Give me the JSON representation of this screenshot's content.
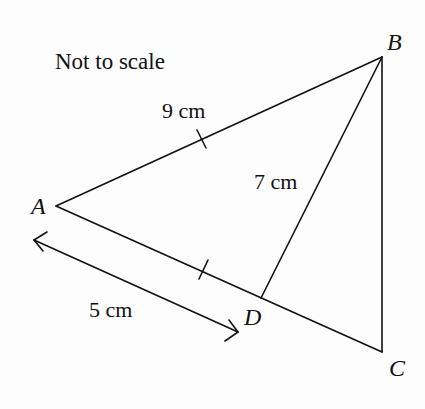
{
  "diagram": {
    "note": "Not to scale",
    "vertices": {
      "A": {
        "label": "A",
        "x": 56,
        "y": 206
      },
      "B": {
        "label": "B",
        "x": 382,
        "y": 57
      },
      "C": {
        "label": "C",
        "x": 382,
        "y": 352
      },
      "D": {
        "label": "D",
        "x": 261,
        "y": 298
      }
    },
    "segments": [
      {
        "from": "A",
        "to": "B",
        "label": "9 cm",
        "tick": true
      },
      {
        "from": "B",
        "to": "C",
        "label": ""
      },
      {
        "from": "A",
        "to": "C",
        "label": ""
      },
      {
        "from": "B",
        "to": "D",
        "label": "7 cm"
      }
    ],
    "dimension_arrow": {
      "label": "5 cm",
      "description": "double-headed arrow alongside A to D"
    },
    "tick_marks": [
      "AB",
      "AD"
    ],
    "labels": {
      "AB": "9 cm",
      "BD": "7 cm",
      "AD": "5 cm"
    },
    "stroke_color": "#111111"
  }
}
